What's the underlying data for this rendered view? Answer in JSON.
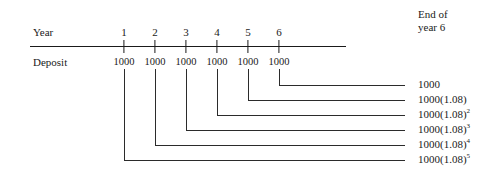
{
  "figure": {
    "type": "timeline-cash-flow-diagram",
    "background": "#ffffff",
    "line_color": "#1a1a1a"
  },
  "rows": {
    "year_label": "Year",
    "deposit_label": "Deposit"
  },
  "corner_heading": {
    "line1": "End of",
    "line2": "year 6"
  },
  "timeline": {
    "years": [
      "1",
      "2",
      "3",
      "4",
      "5",
      "6"
    ],
    "deposits": [
      "1000",
      "1000",
      "1000",
      "1000",
      "1000",
      "1000"
    ]
  },
  "future_values": [
    {
      "base": "1000",
      "exponent": ""
    },
    {
      "base": "1000(1.08)",
      "exponent": ""
    },
    {
      "base": "1000(1.08)",
      "exponent": "2"
    },
    {
      "base": "1000(1.08)",
      "exponent": "3"
    },
    {
      "base": "1000(1.08)",
      "exponent": "4"
    },
    {
      "base": "1000(1.08)",
      "exponent": "5"
    }
  ]
}
